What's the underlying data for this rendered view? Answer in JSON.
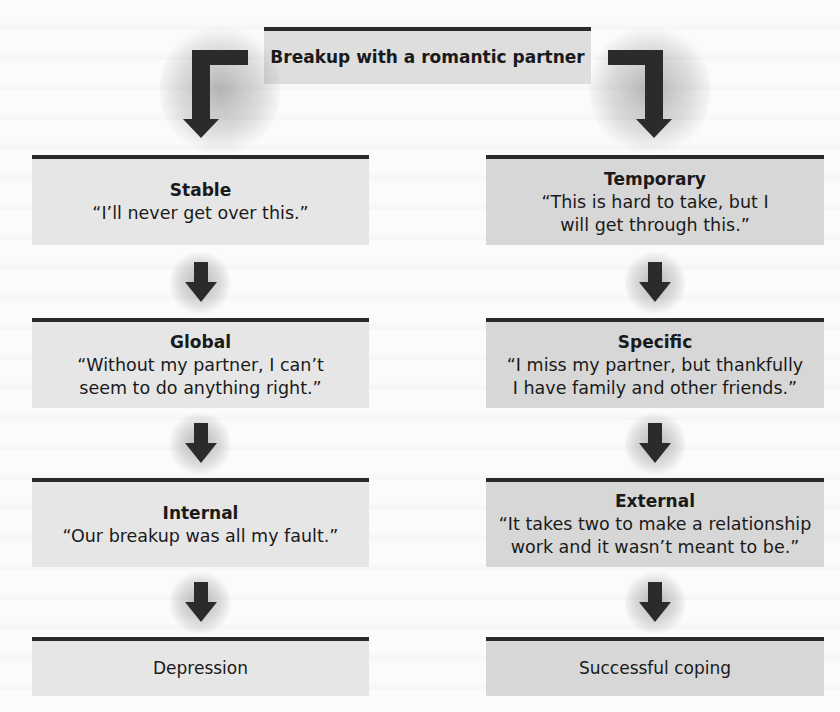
{
  "diagram": {
    "root": {
      "label": "Breakup with a romantic partner"
    },
    "left_path": [
      {
        "title": "Stable",
        "quote": "“I’ll never get over this.”"
      },
      {
        "title": "Global",
        "quote": "“Without my partner, I can’t\nseem to do anything right.”"
      },
      {
        "title": "Internal",
        "quote": "“Our breakup was all my fault.”"
      },
      {
        "title": "Depression",
        "quote": ""
      }
    ],
    "right_path": [
      {
        "title": "Temporary",
        "quote": "“This is hard to take, but I\nwill get through this.”"
      },
      {
        "title": "Specific",
        "quote": "“I miss my partner, but thankfully\nI have family and other friends.”"
      },
      {
        "title": "External",
        "quote": "“It takes two to make a relationship\nwork and it wasn’t meant to be.”"
      },
      {
        "title": "Successful coping",
        "quote": ""
      }
    ],
    "colors": {
      "border": "#2a2a2a",
      "left_box": "#e6e6e6",
      "right_box": "#d7d7d7",
      "root_box": "#dedede",
      "arrow": "#2b2b2b"
    }
  }
}
